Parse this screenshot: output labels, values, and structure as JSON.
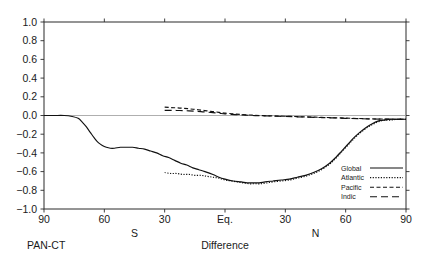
{
  "figure": {
    "corner_label": "PAN-CT",
    "xlabel": "Difference",
    "hemisphere_south": "S",
    "hemisphere_north": "N"
  },
  "legend": {
    "position": "bottom-right",
    "items": [
      {
        "label": "Global",
        "style": "solid"
      },
      {
        "label": "Atlantic",
        "style": "dotted"
      },
      {
        "label": "Pacific",
        "style": "short-dash"
      },
      {
        "label": "Indic",
        "style": "long-dash"
      }
    ]
  },
  "axes": {
    "y_ticks": [
      "1.0",
      "0.8",
      "0.6",
      "0.4",
      "0.2",
      "0.0",
      "-0.2",
      "-0.4",
      "-0.6",
      "-0.8",
      "-1.0"
    ],
    "x_ticks": [
      "90",
      "60",
      "30",
      "Eq.",
      "30",
      "60",
      "90"
    ]
  },
  "chart_data": {
    "type": "line",
    "title": "",
    "subtitle": "",
    "xlabel": "Difference",
    "ylabel": "",
    "xlim": [
      -90,
      90
    ],
    "ylim": [
      -1.0,
      1.0
    ],
    "grid": false,
    "legend_position": "bottom-right",
    "x_tick_values": [
      -90,
      -60,
      -30,
      0,
      30,
      60,
      90
    ],
    "x_tick_labels": [
      "90",
      "60",
      "30",
      "Eq.",
      "30",
      "60",
      "90"
    ],
    "y_tick_values": [
      1.0,
      0.8,
      0.6,
      0.4,
      0.2,
      0.0,
      -0.2,
      -0.4,
      -0.6,
      -0.8,
      -1.0
    ],
    "y_tick_labels": [
      "1.0",
      "0.8",
      "0.6",
      "0.4",
      "0.2",
      "0.0",
      "-0.2",
      "-0.4",
      "-0.6",
      "-0.8",
      "-1.0"
    ],
    "x_axis_note": "latitude, S on left, N on right, Eq. at center",
    "annotations": [
      "PAN-CT"
    ],
    "series": [
      {
        "name": "Global",
        "style": "solid",
        "x": [
          -90,
          -85,
          -80,
          -76,
          -73,
          -71,
          -69,
          -67,
          -65,
          -63,
          -61,
          -59,
          -57,
          -55,
          -52,
          -49,
          -46,
          -43,
          -40,
          -37,
          -34,
          -31,
          -28,
          -25,
          -22,
          -19,
          -16,
          -13,
          -10,
          -6,
          -3,
          0,
          4,
          8,
          11,
          14,
          17,
          20,
          24,
          28,
          32,
          36,
          40,
          44,
          48,
          52,
          55,
          58,
          61,
          64,
          67,
          70,
          73,
          76,
          79,
          82,
          86,
          90
        ],
        "y": [
          0.0,
          0.0,
          0.0,
          -0.01,
          -0.03,
          -0.07,
          -0.12,
          -0.18,
          -0.24,
          -0.29,
          -0.32,
          -0.34,
          -0.35,
          -0.35,
          -0.34,
          -0.34,
          -0.34,
          -0.35,
          -0.36,
          -0.38,
          -0.4,
          -0.43,
          -0.45,
          -0.48,
          -0.51,
          -0.53,
          -0.56,
          -0.58,
          -0.6,
          -0.63,
          -0.66,
          -0.68,
          -0.7,
          -0.71,
          -0.72,
          -0.72,
          -0.72,
          -0.71,
          -0.7,
          -0.69,
          -0.68,
          -0.66,
          -0.64,
          -0.61,
          -0.57,
          -0.51,
          -0.45,
          -0.38,
          -0.31,
          -0.24,
          -0.18,
          -0.13,
          -0.09,
          -0.06,
          -0.05,
          -0.04,
          -0.04,
          -0.04
        ]
      },
      {
        "name": "Atlantic",
        "style": "dotted",
        "x": [
          -30,
          -27,
          -24,
          -21,
          -18,
          -15,
          -12,
          -9,
          -6,
          -3,
          0,
          3,
          6,
          9,
          12,
          15,
          18,
          21,
          24,
          28,
          32,
          36,
          40,
          44,
          48,
          52,
          55,
          58,
          61,
          64,
          67,
          70,
          73,
          76,
          79,
          82,
          86,
          90
        ],
        "y": [
          -0.61,
          -0.62,
          -0.62,
          -0.63,
          -0.63,
          -0.64,
          -0.64,
          -0.65,
          -0.66,
          -0.67,
          -0.69,
          -0.7,
          -0.71,
          -0.72,
          -0.73,
          -0.73,
          -0.73,
          -0.72,
          -0.71,
          -0.7,
          -0.69,
          -0.67,
          -0.65,
          -0.62,
          -0.58,
          -0.52,
          -0.46,
          -0.39,
          -0.32,
          -0.25,
          -0.19,
          -0.14,
          -0.1,
          -0.07,
          -0.05,
          -0.05,
          -0.04,
          -0.04
        ]
      },
      {
        "name": "Pacific",
        "style": "short-dash",
        "x": [
          -30,
          -27,
          -24,
          -21,
          -18,
          -15,
          -12,
          -9,
          -6,
          -3,
          0,
          5,
          10,
          15,
          20,
          25,
          30,
          36,
          42,
          48,
          54,
          60,
          66,
          72,
          78,
          84,
          90
        ],
        "y": [
          0.09,
          0.085,
          0.082,
          0.078,
          0.072,
          0.065,
          0.058,
          0.05,
          0.042,
          0.034,
          0.026,
          0.016,
          0.008,
          0.002,
          -0.002,
          -0.005,
          -0.008,
          -0.012,
          -0.016,
          -0.02,
          -0.024,
          -0.028,
          -0.032,
          -0.036,
          -0.038,
          -0.04,
          -0.041
        ]
      },
      {
        "name": "Indic",
        "style": "long-dash",
        "x": [
          -30,
          -27,
          -24,
          -21,
          -18,
          -15,
          -12,
          -9,
          -6,
          -3,
          0,
          5,
          10,
          15,
          20,
          25,
          30,
          36,
          42,
          48,
          54,
          60,
          66,
          72,
          78,
          84,
          90
        ],
        "y": [
          0.055,
          0.055,
          0.054,
          0.052,
          0.05,
          0.046,
          0.042,
          0.036,
          0.03,
          0.024,
          0.018,
          0.01,
          0.004,
          -0.001,
          -0.004,
          -0.007,
          -0.01,
          -0.014,
          -0.018,
          -0.022,
          -0.026,
          -0.03,
          -0.034,
          -0.037,
          -0.039,
          -0.04,
          -0.041
        ]
      }
    ]
  }
}
